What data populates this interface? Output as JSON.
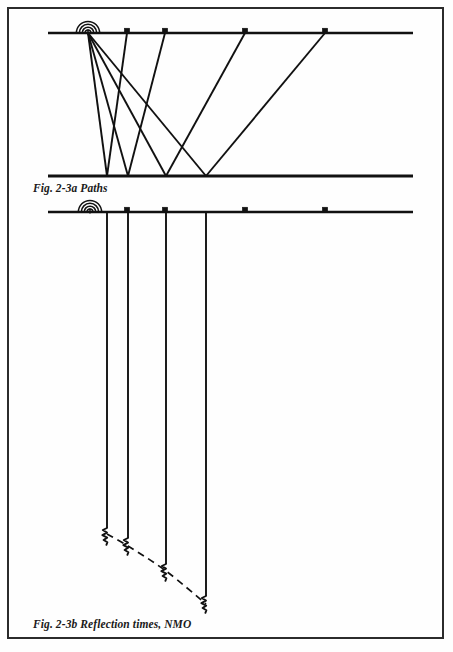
{
  "page": {
    "background_color": "#fefefe",
    "ink_color": "#111111",
    "width": 453,
    "height": 652
  },
  "border": {
    "name": "page-border-frame",
    "x": 8,
    "y": 8,
    "width": 435,
    "height": 630,
    "stroke_color": "#2b2b2b",
    "stroke_width": 2
  },
  "figures": [
    {
      "id": "fig-2-3a",
      "caption": "Fig. 2-3a Paths",
      "caption_x": 33,
      "caption_y": 192,
      "surface_line": {
        "name": "surface-line",
        "x1": 48,
        "x2": 413,
        "y": 33,
        "stroke_width": 2.6
      },
      "reflector_line": {
        "name": "reflector-line",
        "x1": 48,
        "x2": 413,
        "y": 176,
        "stroke_width": 3.0
      },
      "source": {
        "name": "seismic-source-icon",
        "label": "source",
        "x": 88,
        "y": 33
      },
      "receivers": [
        {
          "name": "receiver-geophone-1",
          "x": 127,
          "y": 33
        },
        {
          "name": "receiver-geophone-2",
          "x": 165,
          "y": 33
        },
        {
          "name": "receiver-geophone-3",
          "x": 245,
          "y": 33
        },
        {
          "name": "receiver-geophone-4",
          "x": 325,
          "y": 33
        }
      ],
      "raypaths": [
        {
          "name": "raypath-1",
          "source_x": 88,
          "reflect_x": 107,
          "receiver_x": 127
        },
        {
          "name": "raypath-2",
          "source_x": 88,
          "reflect_x": 128,
          "receiver_x": 165
        },
        {
          "name": "raypath-3",
          "source_x": 88,
          "reflect_x": 166,
          "receiver_x": 245
        },
        {
          "name": "raypath-4",
          "source_x": 88,
          "reflect_x": 206,
          "receiver_x": 325
        }
      ],
      "reflection_points": [
        107,
        128,
        166,
        206
      ]
    },
    {
      "id": "fig-2-3b",
      "caption": "Fig. 2-3b Reflection times, NMO",
      "caption_x": 33,
      "caption_y": 628,
      "surface_line": {
        "name": "surface-line",
        "x1": 48,
        "x2": 413,
        "y": 212,
        "stroke_width": 2.6
      },
      "source": {
        "name": "seismic-source-icon",
        "label": "source",
        "x": 90,
        "y": 212
      },
      "receivers": [
        {
          "name": "receiver-geophone-1",
          "x": 127,
          "y": 212
        },
        {
          "name": "receiver-geophone-2",
          "x": 165,
          "y": 212
        },
        {
          "name": "receiver-geophone-3",
          "x": 245,
          "y": 212
        },
        {
          "name": "receiver-geophone-4",
          "x": 325,
          "y": 212
        }
      ],
      "traces": [
        {
          "name": "seismic-trace-1",
          "x": 107,
          "y_top": 212,
          "y_event": 528
        },
        {
          "name": "seismic-trace-2",
          "x": 128,
          "y_top": 212,
          "y_event": 538
        },
        {
          "name": "seismic-trace-3",
          "x": 166,
          "y_top": 212,
          "y_event": 564
        },
        {
          "name": "seismic-trace-4",
          "x": 206,
          "y_top": 212,
          "y_event": 596
        }
      ],
      "nmo_curve": {
        "name": "nmo-hyperbola-dashed-curve",
        "label": "NMO moveout curve",
        "dash_pattern": "7,5",
        "points": [
          [
            107,
            534
          ],
          [
            128,
            546
          ],
          [
            166,
            571
          ],
          [
            206,
            604
          ]
        ]
      }
    }
  ],
  "chart_data": {
    "type": "line",
    "xlabel": "Offset (source-receiver distance)",
    "ylabel": "Two-way travel time",
    "offsets": [
      39,
      77,
      157,
      237
    ],
    "reflection_times": [
      528,
      538,
      564,
      596
    ],
    "reflection_point_x": [
      107,
      128,
      166,
      206
    ]
  }
}
